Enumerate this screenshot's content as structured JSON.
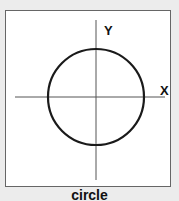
{
  "diagram": {
    "title": "circle",
    "x_axis_label": "X",
    "y_axis_label": "Y",
    "shape": "circle",
    "colors": {
      "stroke": "#1a1a1a",
      "axis": "#555555",
      "frame": "#666666",
      "background": "#ececec"
    }
  }
}
